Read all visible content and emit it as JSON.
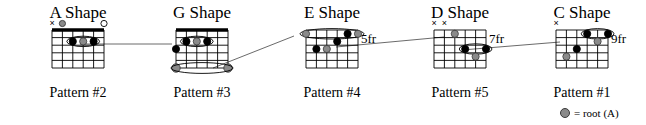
{
  "document": {
    "title": "CAGED System Chord Shapes",
    "type": "guitar-chord-diagram-chart"
  },
  "legend": {
    "symbol_name": "root-dot",
    "text": "= root (A)",
    "root_color": "#8a8a8a",
    "finger_color": "#000000"
  },
  "shapes": [
    {
      "id": "a-shape",
      "title": "A Shape",
      "pattern": "Pattern #2",
      "fret_label": "",
      "has_nut": true,
      "x": 18,
      "strings": 6,
      "frets": 5,
      "top_markers": [
        "x",
        "root",
        "",
        "",
        "",
        "open"
      ],
      "dots": [
        {
          "string": 4,
          "fret": 2,
          "type": "finger"
        },
        {
          "string": 3,
          "fret": 2,
          "type": "root"
        },
        {
          "string": 2,
          "fret": 2,
          "type": "finger"
        }
      ],
      "barre": {
        "fret": 2,
        "from_string": 4,
        "to_string": 2
      },
      "open_roots": []
    },
    {
      "id": "g-shape",
      "title": "G Shape",
      "pattern": "Pattern #3",
      "fret_label": "",
      "has_nut": true,
      "x": 142,
      "strings": 6,
      "frets": 5,
      "top_markers": [
        "",
        "",
        "",
        "",
        "",
        ""
      ],
      "dots": [
        {
          "string": 5,
          "fret": 2,
          "type": "finger"
        },
        {
          "string": 4,
          "fret": 2,
          "type": "root"
        },
        {
          "string": 3,
          "fret": 2,
          "type": "finger"
        },
        {
          "string": 6,
          "fret": 3,
          "type": "finger"
        }
      ],
      "barre": {
        "fret": 2,
        "from_string": 5,
        "to_string": 3
      },
      "open_roots": [
        {
          "string": 6,
          "fret": 5
        },
        {
          "string": 1,
          "fret": 5
        }
      ]
    },
    {
      "id": "e-shape",
      "title": "E Shape",
      "pattern": "Pattern #4",
      "fret_label": "5fr",
      "has_nut": false,
      "x": 272,
      "strings": 6,
      "frets": 5,
      "top_markers": [
        "",
        "",
        "",
        "",
        "",
        ""
      ],
      "dots": [
        {
          "string": 6,
          "fret": 1,
          "type": "root"
        },
        {
          "string": 2,
          "fret": 1,
          "type": "finger"
        },
        {
          "string": 1,
          "fret": 1,
          "type": "root"
        },
        {
          "string": 3,
          "fret": 2,
          "type": "finger"
        },
        {
          "string": 5,
          "fret": 3,
          "type": "finger"
        },
        {
          "string": 4,
          "fret": 3,
          "type": "root"
        }
      ],
      "barre": {
        "fret": 1,
        "from_string": 6,
        "to_string": 1
      },
      "open_roots": []
    },
    {
      "id": "d-shape",
      "title": "D Shape",
      "pattern": "Pattern #5",
      "fret_label": "7fr",
      "has_nut": false,
      "x": 400,
      "strings": 6,
      "frets": 5,
      "top_markers": [
        "x",
        "x",
        "",
        "",
        "",
        ""
      ],
      "dots": [
        {
          "string": 4,
          "fret": 1,
          "type": "root"
        },
        {
          "string": 3,
          "fret": 3,
          "type": "finger"
        },
        {
          "string": 1,
          "fret": 3,
          "type": "finger"
        },
        {
          "string": 2,
          "fret": 4,
          "type": "root"
        }
      ],
      "barre": {
        "fret": 3,
        "from_string": 3,
        "to_string": 1
      },
      "open_roots": []
    },
    {
      "id": "c-shape",
      "title": "C Shape",
      "pattern": "Pattern #1",
      "fret_label": "9fr",
      "has_nut": false,
      "x": 522,
      "strings": 6,
      "frets": 5,
      "top_markers": [
        "x",
        "",
        "",
        "",
        "",
        ""
      ],
      "dots": [
        {
          "string": 3,
          "fret": 1,
          "type": "finger"
        },
        {
          "string": 1,
          "fret": 1,
          "type": "finger"
        },
        {
          "string": 2,
          "fret": 2,
          "type": "root"
        },
        {
          "string": 4,
          "fret": 3,
          "type": "finger"
        },
        {
          "string": 5,
          "fret": 4,
          "type": "root"
        }
      ],
      "barre": {
        "fret": 1,
        "from_string": 3,
        "to_string": 1
      },
      "open_roots": []
    }
  ],
  "connections": [
    {
      "id": "a-to-g",
      "from": "a-shape-root",
      "to": "g-shape-root",
      "x1": 80,
      "y1": 44,
      "x2": 172,
      "y2": 44
    },
    {
      "id": "g-to-e",
      "from": "g-shape-low-root",
      "to": "e-shape-root",
      "x1": 213,
      "y1": 68,
      "x2": 294,
      "y2": 36
    },
    {
      "id": "e-to-d",
      "from": "e-shape-root",
      "to": "d-shape-root",
      "x1": 336,
      "y1": 47,
      "x2": 444,
      "y2": 37
    },
    {
      "id": "d-to-c",
      "from": "d-shape-root",
      "to": "c-shape-root",
      "x1": 462,
      "y1": 50,
      "x2": 560,
      "y2": 42
    }
  ]
}
